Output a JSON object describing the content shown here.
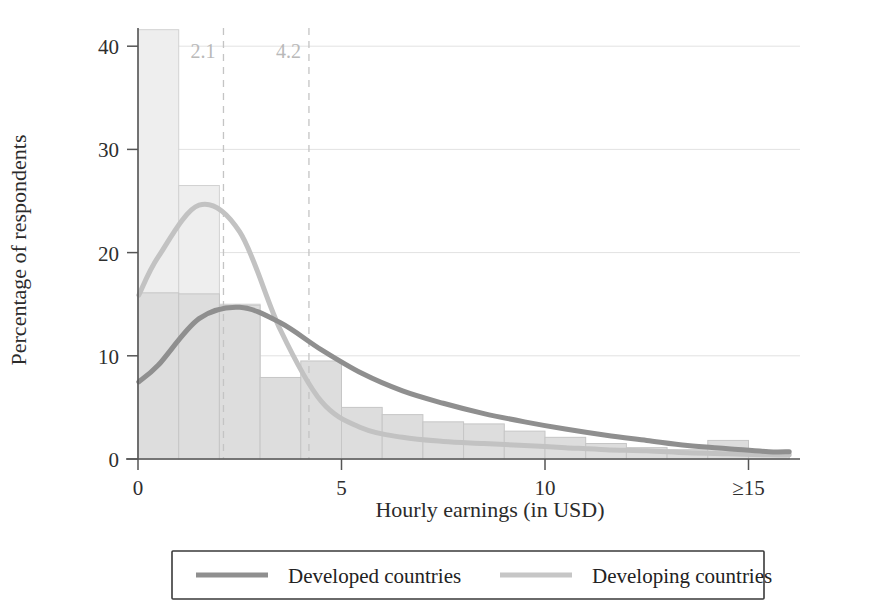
{
  "chart_data": {
    "type": "bar",
    "title": "",
    "xlabel": "Hourly earnings (in USD)",
    "ylabel": "Percentage of respondents",
    "xlim": [
      0,
      16
    ],
    "ylim": [
      0,
      43
    ],
    "grid": true,
    "x_ticks": [
      {
        "value": 0,
        "label": "0"
      },
      {
        "value": 5,
        "label": "5"
      },
      {
        "value": 10,
        "label": "10"
      },
      {
        "value": 15,
        "label": "≥15"
      }
    ],
    "y_ticks": [
      {
        "value": 0,
        "label": "0"
      },
      {
        "value": 10,
        "label": "10"
      },
      {
        "value": 20,
        "label": "20"
      },
      {
        "value": 30,
        "label": "30"
      },
      {
        "value": 40,
        "label": "40"
      }
    ],
    "bin_edges": [
      0,
      1,
      2,
      3,
      4,
      5,
      6,
      7,
      8,
      9,
      10,
      11,
      12,
      13,
      14,
      15,
      16
    ],
    "bin_centers": [
      0.5,
      1.5,
      2.5,
      3.5,
      4.5,
      5.5,
      6.5,
      7.5,
      8.5,
      9.5,
      10.5,
      11.5,
      12.5,
      13.5,
      14.5,
      15.5
    ],
    "series": [
      {
        "name": "Developing countries",
        "kind": "histogram+density",
        "color": "#c2c2c2",
        "bar_fill": "#eeeeee",
        "values": [
          41.6,
          26.5,
          15.0,
          5.2,
          2.0,
          1.1,
          0.7,
          0.5,
          0.4,
          0.4,
          0.3,
          0.2,
          0.2,
          0.1,
          0.1,
          0.1
        ],
        "density": [
          19.6,
          24.6,
          22.0,
          12.5,
          5.6,
          3.0,
          2.1,
          1.7,
          1.5,
          1.3,
          1.1,
          0.9,
          0.8,
          0.6,
          0.5,
          0.4
        ]
      },
      {
        "name": "Developed countries",
        "kind": "histogram+density",
        "color": "#8f8f8f",
        "bar_fill": "#dddddd",
        "values": [
          16.1,
          16.0,
          14.9,
          7.9,
          9.5,
          5.0,
          4.3,
          3.6,
          3.4,
          2.7,
          2.1,
          1.5,
          1.1,
          0.9,
          1.8,
          0.6
        ],
        "density": [
          9.1,
          13.6,
          14.7,
          13.2,
          10.6,
          8.3,
          6.6,
          5.4,
          4.4,
          3.6,
          2.9,
          2.3,
          1.8,
          1.3,
          1.0,
          0.7
        ]
      }
    ],
    "reference_lines": [
      {
        "value": 2.1,
        "label": "2.1",
        "style": "dashed",
        "color": "#c4c4c4"
      },
      {
        "value": 4.2,
        "label": "4.2",
        "style": "dashed",
        "color": "#c4c4c4"
      }
    ],
    "legend": {
      "position": "bottom",
      "entries": [
        {
          "label": "Developed countries",
          "color": "#8f8f8f"
        },
        {
          "label": "Developing countries",
          "color": "#c6c6c6"
        }
      ]
    }
  }
}
